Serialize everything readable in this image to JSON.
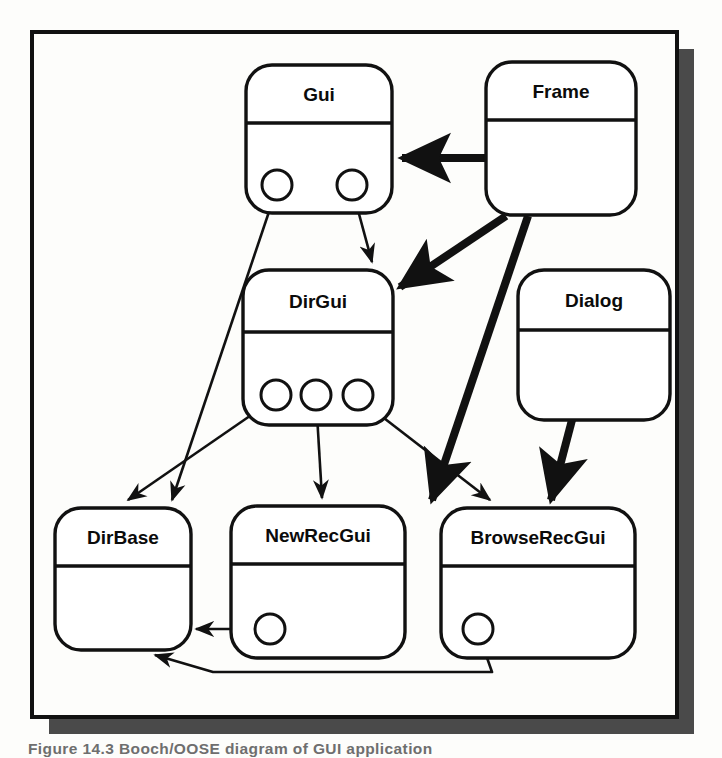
{
  "figure": {
    "kind": "booch-class-diagram",
    "caption": "Figure 14.3  Booch/OOSE diagram of GUI application",
    "frame": {
      "x": 32,
      "y": 32,
      "width": 645,
      "height": 685,
      "border_color": "#111111",
      "border_width": 4,
      "fill": "#fdfdfb",
      "shadow_color": "#4a4a4a",
      "shadow_offset": 17
    }
  },
  "classes": [
    {
      "id": "gui",
      "name": "Gui",
      "x": 246,
      "y": 65,
      "width": 146,
      "height": 148,
      "radius": 26,
      "divider_y_offset": 58,
      "ports": [
        {
          "id": "gui-port-1",
          "cx": 277,
          "cy": 185,
          "r": 15
        },
        {
          "id": "gui-port-2",
          "cx": 352,
          "cy": 185,
          "r": 15
        }
      ]
    },
    {
      "id": "frame",
      "name": "Frame",
      "x": 486,
      "y": 62,
      "width": 150,
      "height": 153,
      "radius": 26,
      "divider_y_offset": 58,
      "ports": []
    },
    {
      "id": "dirgui",
      "name": "DirGui",
      "x": 243,
      "y": 270,
      "width": 150,
      "height": 155,
      "radius": 26,
      "divider_y_offset": 62,
      "ports": [
        {
          "id": "dirgui-port-1",
          "cx": 276,
          "cy": 395,
          "r": 15
        },
        {
          "id": "dirgui-port-2",
          "cx": 316,
          "cy": 395,
          "r": 15
        },
        {
          "id": "dirgui-port-3",
          "cx": 358,
          "cy": 395,
          "r": 15
        }
      ]
    },
    {
      "id": "dialog",
      "name": "Dialog",
      "x": 518,
      "y": 270,
      "width": 152,
      "height": 150,
      "radius": 26,
      "divider_y_offset": 60,
      "ports": []
    },
    {
      "id": "dirbase",
      "name": "DirBase",
      "x": 55,
      "y": 508,
      "width": 136,
      "height": 142,
      "radius": 26,
      "divider_y_offset": 58,
      "ports": []
    },
    {
      "id": "newrecgui",
      "name": "NewRecGui",
      "x": 231,
      "y": 506,
      "width": 174,
      "height": 152,
      "radius": 26,
      "divider_y_offset": 58,
      "ports": [
        {
          "id": "newrecgui-port-1",
          "cx": 270,
          "cy": 629,
          "r": 15
        }
      ]
    },
    {
      "id": "browserecgui",
      "name": "BrowseRecGui",
      "x": 441,
      "y": 508,
      "width": 194,
      "height": 150,
      "radius": 26,
      "divider_y_offset": 58,
      "ports": [
        {
          "id": "browserecgui-port-1",
          "cx": 478,
          "cy": 629,
          "r": 15
        }
      ]
    }
  ],
  "connections": [
    {
      "id": "frame-to-gui",
      "from": "frame",
      "to": "gui",
      "style": "inherits",
      "weight": "thick",
      "path": "M 486 158 L 402 158",
      "arrow": "solid"
    },
    {
      "id": "frame-to-dirgui",
      "from": "frame",
      "to": "dirgui",
      "style": "inherits",
      "weight": "thick",
      "path": "M 506 216 L 400 287",
      "arrow": "solid"
    },
    {
      "id": "frame-to-browserecgui",
      "from": "frame",
      "to": "browserecgui",
      "style": "inherits",
      "weight": "thick",
      "path": "M 528 216 L 432 500",
      "arrow": "solid"
    },
    {
      "id": "dialog-to-browserecgui",
      "from": "dialog",
      "to": "browserecgui",
      "style": "inherits",
      "weight": "thick",
      "path": "M 572 420 L 551 500",
      "arrow": "solid"
    },
    {
      "id": "gui-port1-to-dirbase",
      "from": "gui-port-1",
      "to": "dirbase",
      "style": "uses",
      "weight": "thin",
      "path": "M 277 188 L 172 500",
      "arrow": "open"
    },
    {
      "id": "gui-port2-to-dirgui",
      "from": "gui-port-2",
      "to": "dirgui",
      "style": "uses",
      "weight": "thin",
      "path": "M 352 188 L 372 262",
      "arrow": "open"
    },
    {
      "id": "dirgui-port1-to-dirbase",
      "from": "dirgui-port-1",
      "to": "dirbase",
      "style": "uses",
      "weight": "thin",
      "path": "M 276 398 L 128 500",
      "arrow": "open"
    },
    {
      "id": "dirgui-port2-to-newrecgui",
      "from": "dirgui-port-2",
      "to": "newrecgui",
      "style": "uses",
      "weight": "thin",
      "path": "M 316 398 L 322 498",
      "arrow": "open"
    },
    {
      "id": "dirgui-port3-to-browserecgui",
      "from": "dirgui-port-3",
      "to": "browserecgui",
      "style": "uses",
      "weight": "thin",
      "path": "M 358 398 L 490 500",
      "arrow": "open"
    },
    {
      "id": "newrecgui-port1-to-dirbase",
      "from": "newrecgui-port-1",
      "to": "dirbase",
      "style": "uses",
      "weight": "thin",
      "path": "M 270 629 L 196 629",
      "arrow": "open"
    },
    {
      "id": "browserecgui-port1-to-dirbase",
      "from": "browserecgui-port-1",
      "to": "dirbase",
      "style": "uses",
      "weight": "thin",
      "path": "M 478 632 L 492 672 L 213 672 L 155 655",
      "arrow": "open"
    }
  ]
}
